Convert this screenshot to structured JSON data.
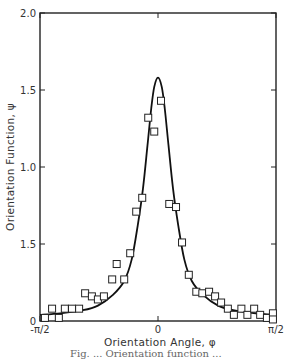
{
  "chart_data": {
    "type": "scatter",
    "title": "",
    "xlabel": "Orientation Angle, φ",
    "ylabel": "Orientation Function, ψ",
    "xlim": [
      -1.5708,
      1.5708
    ],
    "ylim": [
      0,
      2.0
    ],
    "x_ticks": [
      {
        "value": -1.5708,
        "label": "-π/2"
      },
      {
        "value": 0,
        "label": "0"
      },
      {
        "value": 1.5708,
        "label": "π/2"
      }
    ],
    "y_ticks": [
      {
        "value": 0,
        "label": "0"
      },
      {
        "value": 0.5,
        "label": "1.5"
      },
      {
        "value": 1.0,
        "label": "1.0"
      },
      {
        "value": 1.5,
        "label": "1.5"
      },
      {
        "value": 2.0,
        "label": "2.0"
      }
    ],
    "grid": false,
    "legend": null,
    "series": [
      {
        "name": "measured",
        "kind": "scatter",
        "marker": "open-square",
        "x": [
          -1.505,
          -1.41,
          -1.32,
          -1.24,
          -1.145,
          -1.05,
          -0.97,
          -0.88,
          -0.8,
          -0.72,
          -0.61,
          -0.55,
          -0.45,
          -0.37,
          -0.29,
          -0.21,
          -0.13,
          -0.05,
          0.04,
          0.15,
          0.24,
          0.32,
          0.41,
          0.51,
          0.59,
          0.68,
          0.76,
          0.84,
          0.93,
          1.01,
          1.11,
          1.19,
          1.28,
          1.36,
          1.45,
          1.53,
          1.53
        ],
        "y": [
          0.02,
          0.08,
          0.02,
          0.08,
          0.08,
          0.08,
          0.18,
          0.16,
          0.14,
          0.16,
          0.27,
          0.37,
          0.27,
          0.44,
          0.71,
          0.8,
          1.32,
          1.23,
          1.43,
          0.76,
          0.74,
          0.51,
          0.3,
          0.19,
          0.18,
          0.19,
          0.16,
          0.12,
          0.08,
          0.04,
          0.08,
          0.04,
          0.08,
          0.04,
          0.02,
          0.05,
          0.01
        ]
      },
      {
        "name": "theoretical",
        "kind": "line",
        "x": [
          -1.5708,
          -1.3,
          -1.0,
          -0.8,
          -0.6,
          -0.45,
          -0.35,
          -0.27,
          -0.2,
          -0.14,
          -0.09,
          -0.05,
          0.0,
          0.05,
          0.09,
          0.14,
          0.2,
          0.27,
          0.35,
          0.45,
          0.6,
          0.8,
          1.0,
          1.3,
          1.5708
        ],
        "y": [
          0.04,
          0.05,
          0.07,
          0.1,
          0.17,
          0.26,
          0.4,
          0.62,
          0.86,
          1.14,
          1.38,
          1.52,
          1.58,
          1.52,
          1.38,
          1.14,
          0.86,
          0.62,
          0.4,
          0.26,
          0.17,
          0.1,
          0.07,
          0.05,
          0.04
        ]
      }
    ]
  },
  "caption": "Fig. ... Orientation function ..."
}
